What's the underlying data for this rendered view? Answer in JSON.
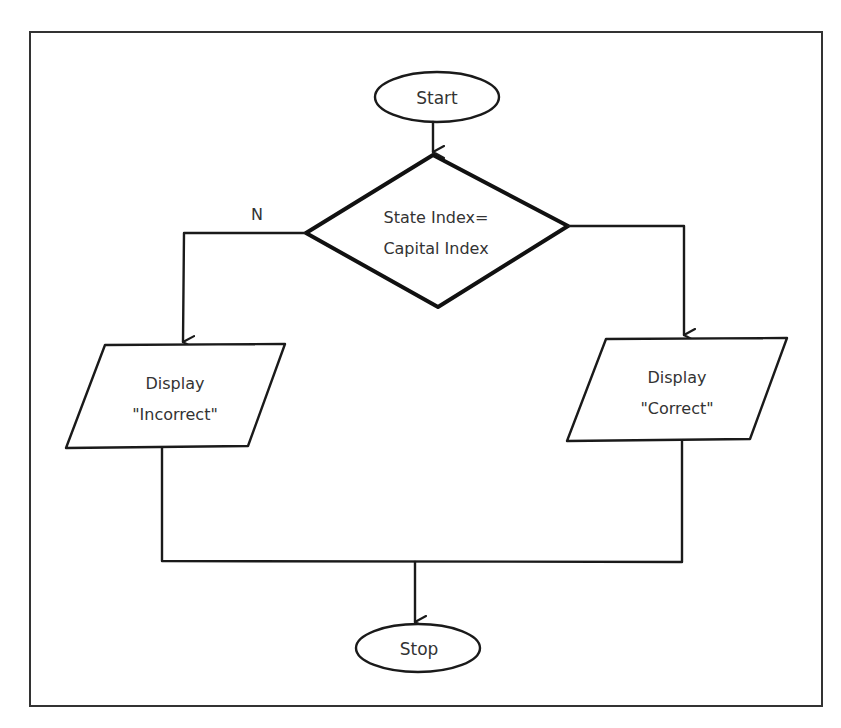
{
  "diagram": {
    "type": "flowchart",
    "nodes": {
      "start": {
        "shape": "terminator",
        "label": "Start"
      },
      "decision": {
        "shape": "diamond",
        "line1": "State Index=",
        "line2": "Capital Index"
      },
      "incorrect": {
        "shape": "parallelogram",
        "line1": "Display",
        "line2": "\"Incorrect\""
      },
      "correct": {
        "shape": "parallelogram",
        "line1": "Display",
        "line2": "\"Correct\""
      },
      "stop": {
        "shape": "terminator",
        "label": "Stop"
      }
    },
    "edges": [
      {
        "from": "start",
        "to": "decision",
        "label": ""
      },
      {
        "from": "decision",
        "to": "incorrect",
        "label": "N"
      },
      {
        "from": "decision",
        "to": "correct",
        "label": ""
      },
      {
        "from": "incorrect",
        "to": "stop",
        "label": ""
      },
      {
        "from": "correct",
        "to": "stop",
        "label": ""
      }
    ],
    "branch_label_no": "N",
    "colors": {
      "stroke": "#1a1a1a",
      "background": "#ffffff",
      "text": "#333333"
    }
  }
}
